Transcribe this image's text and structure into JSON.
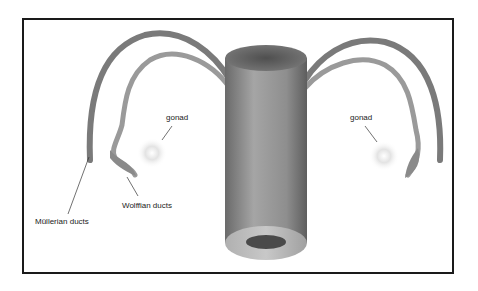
{
  "diagram": {
    "labels": {
      "gonad_left": "gonad",
      "gonad_right": "gonad",
      "wolffian": "Wolffian ducts",
      "mullerian": "Müllerian ducts"
    },
    "colors": {
      "frame": "#1a1a1a",
      "mullerian_duct": "#7a7a7a",
      "wolffian_duct": "#9a9a9a",
      "cylinder_dark": "#555555",
      "cylinder_light": "#a8a8a8",
      "lumen": "#4a4a4a",
      "gonad": "#e0e0e0"
    }
  }
}
